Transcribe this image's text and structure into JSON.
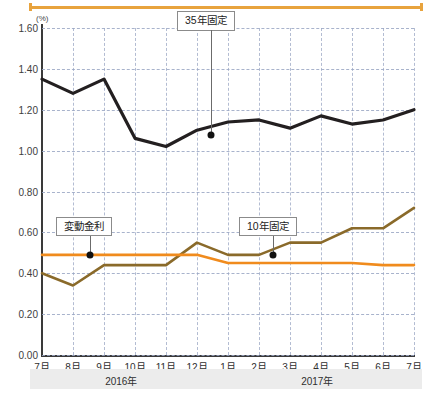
{
  "axis": {
    "unit_label": "(%)",
    "y_ticks": [
      "1.60",
      "1.40",
      "1.20",
      "1.00",
      "0.80",
      "0.60",
      "0.40",
      "0.20",
      "0.00"
    ],
    "x_ticks": [
      "7月",
      "8月",
      "9月",
      "10月",
      "11月",
      "12月",
      "1月",
      "2月",
      "3月",
      "4月",
      "5月",
      "6月",
      "7月"
    ],
    "year_left": "2016年",
    "year_right": "2017年"
  },
  "callouts": {
    "fixed35": "35年固定",
    "variable": "変動金利",
    "fixed10": "10年固定"
  },
  "colors": {
    "fixed35": "#231f20",
    "fixed10": "#8a6a2a",
    "variable": "#f08b1d",
    "grid": "#9aa6c4",
    "accent_rule": "#e8a33d",
    "year_band": "#ececec"
  },
  "chart_data": {
    "type": "line",
    "title": "",
    "xlabel": "",
    "ylabel": "(%)",
    "ylim": [
      0.0,
      1.6
    ],
    "ytick_step": 0.2,
    "grid": true,
    "legend": "annotated-callouts",
    "x": [
      "2016-07",
      "2016-08",
      "2016-09",
      "2016-10",
      "2016-11",
      "2016-12",
      "2017-01",
      "2017-02",
      "2017-03",
      "2017-04",
      "2017-05",
      "2017-06",
      "2017-07"
    ],
    "categories": [
      "7月",
      "8月",
      "9月",
      "10月",
      "11月",
      "12月",
      "1月",
      "2月",
      "3月",
      "4月",
      "5月",
      "6月",
      "7月"
    ],
    "series": [
      {
        "name": "35年固定",
        "color": "#231f20",
        "values": [
          1.35,
          1.28,
          1.35,
          1.06,
          1.02,
          1.1,
          1.14,
          1.15,
          1.11,
          1.17,
          1.13,
          1.15,
          1.2
        ]
      },
      {
        "name": "10年固定",
        "color": "#8a6a2a",
        "values": [
          0.4,
          0.34,
          0.44,
          0.44,
          0.44,
          0.55,
          0.49,
          0.49,
          0.55,
          0.55,
          0.62,
          0.62,
          0.72
        ]
      },
      {
        "name": "変動金利",
        "color": "#f08b1d",
        "values": [
          0.49,
          0.49,
          0.49,
          0.49,
          0.49,
          0.49,
          0.45,
          0.45,
          0.45,
          0.45,
          0.45,
          0.44,
          0.44
        ]
      }
    ],
    "annotations": [
      {
        "label": "35年固定",
        "series": "35年固定",
        "at_x": 5.45,
        "at_y": 1.075
      },
      {
        "label": "変動金利",
        "series": "変動金利",
        "at_x": 1.55,
        "at_y": 0.49
      },
      {
        "label": "10年固定",
        "series": "10年固定",
        "at_x": 7.45,
        "at_y": 0.49
      }
    ]
  }
}
